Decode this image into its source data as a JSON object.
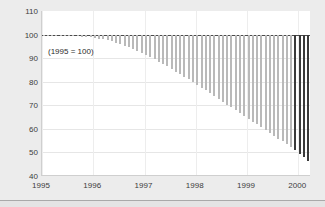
{
  "chart_data": {
    "type": "bar",
    "title": "",
    "subtitle": "",
    "annotation": "(1995 = 100)",
    "xlabel": "",
    "ylabel": "",
    "ylim": [
      40,
      110
    ],
    "yticks": [
      110,
      100,
      90,
      80,
      70,
      60,
      50,
      40
    ],
    "xticks": [
      "1995",
      "1996",
      "1997",
      "1998",
      "1999",
      "2000"
    ],
    "xlim": [
      1995.0,
      2000.25
    ],
    "grid": true,
    "legend": "none",
    "baseline": 100,
    "bar_orientation": "vertical-hanging-from-baseline",
    "series": [
      {
        "name": "Index (1995 = 100)",
        "x": [
          1995.0,
          1995.083,
          1995.167,
          1995.25,
          1995.333,
          1995.417,
          1995.5,
          1995.583,
          1995.667,
          1995.75,
          1995.833,
          1995.917,
          1996.0,
          1996.083,
          1996.167,
          1996.25,
          1996.333,
          1996.417,
          1996.5,
          1996.583,
          1996.667,
          1996.75,
          1996.833,
          1996.917,
          1997.0,
          1997.083,
          1997.167,
          1997.25,
          1997.333,
          1997.417,
          1997.5,
          1997.583,
          1997.667,
          1997.75,
          1997.833,
          1997.917,
          1998.0,
          1998.083,
          1998.167,
          1998.25,
          1998.333,
          1998.417,
          1998.5,
          1998.583,
          1998.667,
          1998.75,
          1998.833,
          1998.917,
          1999.0,
          1999.083,
          1999.167,
          1999.25,
          1999.333,
          1999.417,
          1999.5,
          1999.583,
          1999.667,
          1999.75,
          1999.833,
          1999.917,
          2000.0,
          2000.083,
          2000.167
        ],
        "values": [
          100.0,
          99.9,
          99.8,
          99.7,
          99.6,
          99.5,
          99.4,
          99.3,
          99.2,
          99.1,
          99.0,
          98.8,
          98.6,
          98.3,
          98.0,
          97.6,
          97.1,
          96.6,
          96.0,
          95.3,
          94.6,
          93.8,
          93.0,
          92.2,
          91.3,
          90.4,
          89.5,
          88.5,
          87.5,
          86.5,
          85.4,
          84.3,
          83.2,
          82.1,
          81.0,
          79.9,
          78.7,
          77.5,
          76.3,
          75.1,
          73.9,
          72.7,
          71.5,
          70.3,
          69.1,
          67.9,
          66.7,
          65.5,
          64.3,
          63.1,
          61.9,
          60.7,
          59.5,
          58.3,
          57.1,
          55.9,
          54.7,
          53.5,
          52.3,
          51.1,
          49.5,
          48.0,
          46.2
        ],
        "highlight_last_n": 4
      }
    ],
    "colors": {
      "bar": "#b9b9b9",
      "bar_highlight": "#3a3a3a",
      "baseline": "#4a4a4a",
      "plot_background": "#ffffff",
      "figure_background": "#ececec",
      "grid": "#e6e6e6",
      "text": "#3c3c3c"
    }
  }
}
